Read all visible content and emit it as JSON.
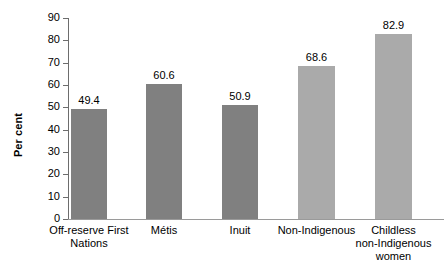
{
  "chart_data": {
    "type": "bar",
    "title": "",
    "subtitle": "",
    "xlabel": "",
    "ylabel": "Per cent",
    "ylim": [
      0,
      90
    ],
    "ytick_step": 10,
    "yticks": [
      90,
      80,
      70,
      60,
      50,
      40,
      30,
      20,
      10,
      0
    ],
    "ytick_labels": [
      "90",
      "80",
      "70",
      "60",
      "50",
      "40",
      "30",
      "20",
      "10",
      "0"
    ],
    "grid": false,
    "legend": "none",
    "categories": [
      "Off-reserve First\nNations",
      "Métis",
      "Inuit",
      "Non-Indigenous",
      "Childless\nnon-Indigenous\nwomen"
    ],
    "values": [
      49.4,
      60.6,
      50.9,
      68.6,
      82.9
    ],
    "value_labels": [
      "49.4",
      "60.6",
      "50.9",
      "68.6",
      "82.9"
    ],
    "bar_colors": [
      "#808080",
      "#808080",
      "#808080",
      "#aaaaaa",
      "#aaaaaa"
    ],
    "axis_color": "#6d6d6d",
    "baseline_color": "#9a9a9a",
    "background": "#ffffff",
    "bars": [
      {
        "label": "Off-reserve First\nNations",
        "value": 49.4,
        "value_label": "49.4",
        "color": "#808080",
        "left": 71,
        "width": 36
      },
      {
        "label": "Métis",
        "value": 60.6,
        "value_label": "60.6",
        "color": "#808080",
        "left": 146,
        "width": 36
      },
      {
        "label": "Inuit",
        "value": 50.9,
        "value_label": "50.9",
        "color": "#808080",
        "left": 222,
        "width": 36
      },
      {
        "label": "Non-Indigenous",
        "value": 68.6,
        "value_label": "68.6",
        "color": "#aaaaaa",
        "left": 298,
        "width": 37
      },
      {
        "label": "Childless\nnon-Indigenous\nwomen",
        "value": 82.9,
        "value_label": "82.9",
        "color": "#aaaaaa",
        "left": 375,
        "width": 37
      }
    ]
  }
}
